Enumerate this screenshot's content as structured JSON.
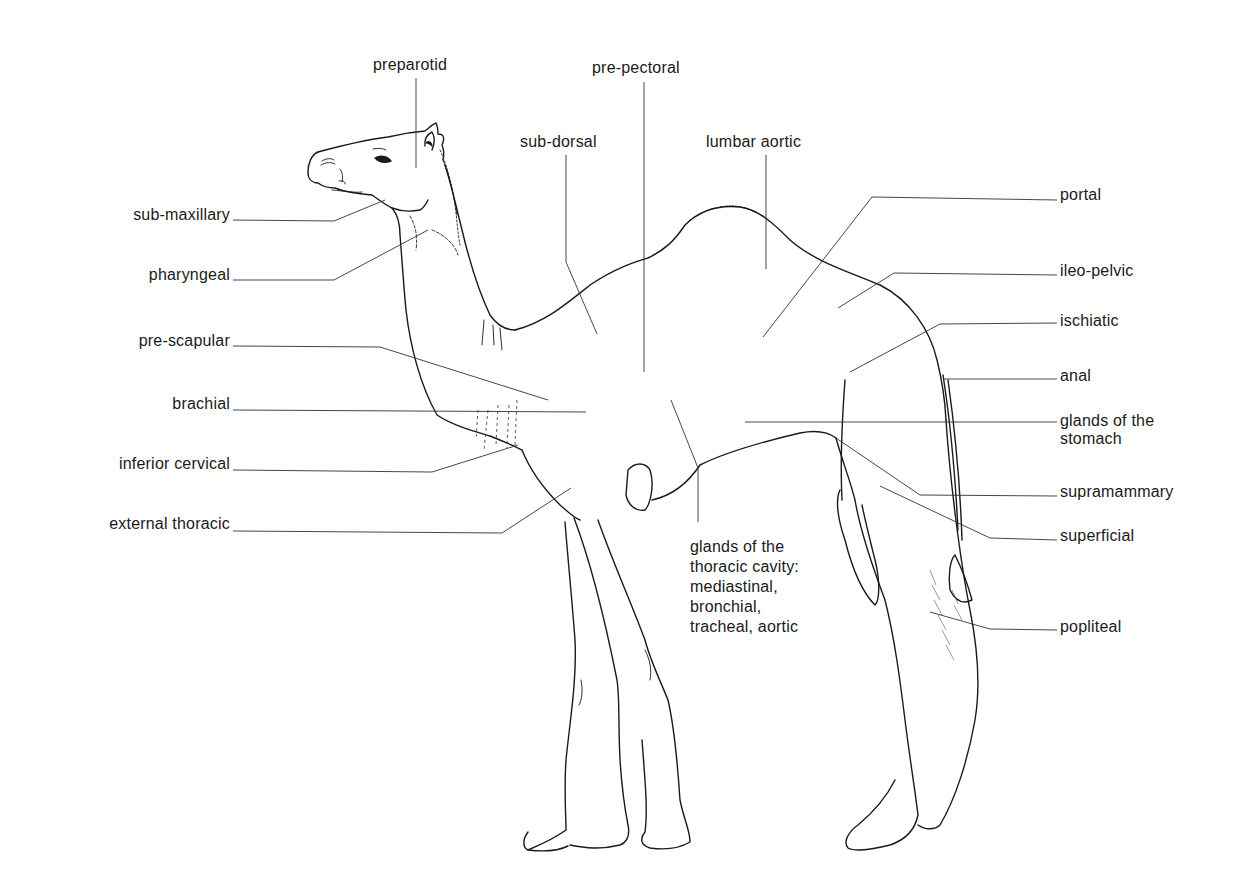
{
  "diagram": {
    "colors": {
      "line": "#1a1a1a",
      "background": "#ffffff"
    },
    "labels": {
      "preparotid": "preparotid",
      "pre_pectoral": "pre-pectoral",
      "sub_dorsal": "sub-dorsal",
      "lumbar_aortic": "lumbar aortic",
      "portal": "portal",
      "ileo_pelvic": "ileo-pelvic",
      "ischiatic": "ischiatic",
      "anal": "anal",
      "glands_stomach": "glands of the\nstomach",
      "supramammary": "supramammary",
      "superficial": "superficial",
      "popliteal": "popliteal",
      "sub_maxillary": "sub-maxillary",
      "pharyngeal": "pharyngeal",
      "pre_scapular": "pre-scapular",
      "brachial": "brachial",
      "inferior_cervical": "inferior cervical",
      "external_thoracic": "external thoracic",
      "thoracic_cavity": "glands of the\nthoracic cavity:\nmediastinal,\nbronchial,\ntracheal, aortic"
    }
  }
}
